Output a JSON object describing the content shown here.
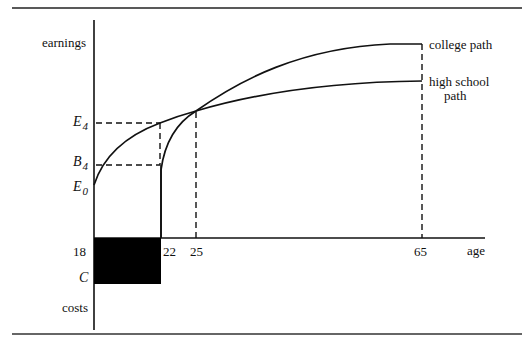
{
  "figure": {
    "y_axis_top_label": "earnings",
    "y_axis_bottom_label": "costs",
    "x_axis_label": "age",
    "y_ticks": {
      "E4": {
        "main": "E",
        "sub": "4"
      },
      "B4": {
        "main": "B",
        "sub": "4"
      },
      "E0": {
        "main": "E",
        "sub": "0"
      },
      "C": "C"
    },
    "x_ticks": [
      "18",
      "22",
      "25",
      "65"
    ],
    "curves": {
      "college": "college path",
      "high_school_line1": "high school",
      "high_school_line2": "path"
    },
    "colors": {
      "ink": "#111111",
      "background": "#ffffff"
    }
  }
}
